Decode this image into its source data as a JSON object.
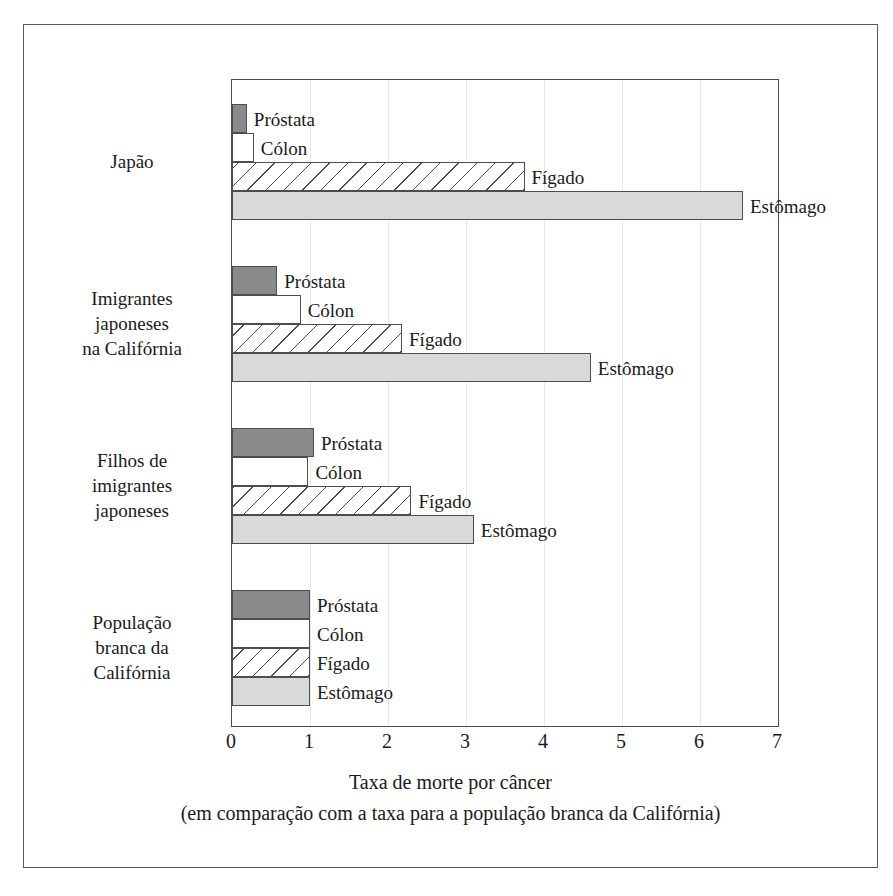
{
  "chart_data": {
    "type": "bar",
    "orientation": "horizontal",
    "title": "",
    "xlabel": "Taxa de morte por câncer",
    "xlabel_sub": "(em comparação com a taxa para a população branca da Califórnia)",
    "ylabel": "",
    "xlim": [
      0,
      7
    ],
    "xticks": [
      0,
      1,
      2,
      3,
      4,
      5,
      6,
      7
    ],
    "xtick_labels": [
      "0",
      "1",
      "2",
      "3",
      "4",
      "5",
      "6",
      "7"
    ],
    "grid": true,
    "legend": "inline-labels",
    "categories": [
      "Japão",
      "Imigrantes japoneses na Califórnia",
      "Filhos de imigrantes japoneses",
      "População branca da Califórnia"
    ],
    "series": [
      {
        "name": "Próstata",
        "values": [
          0.19,
          0.58,
          1.05,
          1.0
        ]
      },
      {
        "name": "Cólon",
        "values": [
          0.28,
          0.88,
          0.98,
          1.0
        ]
      },
      {
        "name": "Fígado",
        "values": [
          3.75,
          2.18,
          2.3,
          1.0
        ]
      },
      {
        "name": "Estômago",
        "values": [
          6.55,
          4.6,
          3.1,
          1.0
        ]
      }
    ]
  },
  "category_labels": [
    {
      "lines": [
        "Japão"
      ]
    },
    {
      "lines": [
        "Imigrantes",
        "japoneses",
        "na Califórnia"
      ]
    },
    {
      "lines": [
        "Filhos de",
        "imigrantes",
        "japoneses"
      ]
    },
    {
      "lines": [
        "População",
        "branca da",
        "Califórnia"
      ]
    }
  ],
  "bar_labels": {
    "prostata": "Próstata",
    "colon": "Cólon",
    "figado": "Fígado",
    "estomago": "Estômago"
  },
  "axis": {
    "caption_line1": "Taxa de morte por câncer",
    "caption_line2": "(em comparação com a taxa para a população branca da Califórnia)"
  },
  "colors": {
    "prostata": "#8a8a8a",
    "colon": "#ffffff",
    "figado": "#ffffff",
    "estomago": "#d9d9d9",
    "outline": "#4d4d4d",
    "frame": "#5a5a5a",
    "gridline": "#e8e8e8",
    "text": "#1a1a1a"
  }
}
